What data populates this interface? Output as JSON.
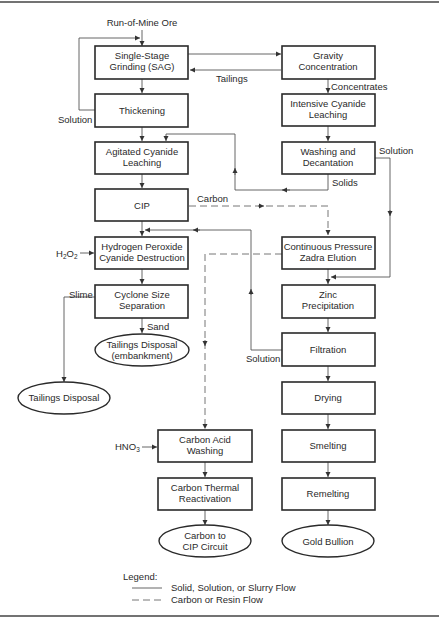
{
  "diagram": {
    "input_label": "Run-of-Mine Ore",
    "nodes": {
      "sag": {
        "line1": "Single-Stage",
        "line2": "Grinding (SAG)"
      },
      "thickening": {
        "line1": "Thickening"
      },
      "agitated": {
        "line1": "Agitated Cyanide",
        "line2": "Leaching"
      },
      "cip": {
        "line1": "CIP"
      },
      "peroxide": {
        "line1": "Hydrogen Peroxide",
        "line2": "Cyanide Destruction"
      },
      "cyclone": {
        "line1": "Cyclone Size",
        "line2": "Separation"
      },
      "tailings_embankment": {
        "line1": "Tailings Disposal",
        "line2": "(embankment)"
      },
      "tailings": {
        "line1": "Tailings Disposal"
      },
      "gravity": {
        "line1": "Gravity",
        "line2": "Concentration"
      },
      "intensive": {
        "line1": "Intensive Cyanide",
        "line2": "Leaching"
      },
      "washing": {
        "line1": "Washing and",
        "line2": "Decantation"
      },
      "zadra": {
        "line1": "Continuous Pressure",
        "line2": "Zadra Elution"
      },
      "zinc": {
        "line1": "Zinc",
        "line2": "Precipitation"
      },
      "filtration": {
        "line1": "Filtration"
      },
      "drying": {
        "line1": "Drying"
      },
      "smelting": {
        "line1": "Smelting"
      },
      "remelting": {
        "line1": "Remelting"
      },
      "gold": {
        "line1": "Gold Bullion"
      },
      "acid_wash": {
        "line1": "Carbon Acid",
        "line2": "Washing"
      },
      "thermal": {
        "line1": "Carbon Thermal",
        "line2": "Reactivation"
      },
      "carbon_cip": {
        "line1": "Carbon to",
        "line2": "CIP Circuit"
      }
    },
    "edge_labels": {
      "tailings": "Tailings",
      "concentrates": "Concentrates",
      "solution_thickening": "Solution",
      "solution_washing": "Solution",
      "solids": "Solids",
      "carbon": "Carbon",
      "slime": "Slime",
      "sand": "Sand",
      "solution_filtration": "Solution",
      "h2o2_main": "H",
      "h2o2_sub1": "2",
      "h2o2_mid": "O",
      "h2o2_sub2": "2",
      "hno3_main": "HNO",
      "hno3_sub": "3"
    },
    "legend": {
      "title": "Legend:",
      "solid": "Solid, Solution, or Slurry Flow",
      "dashed": "Carbon or Resin Flow"
    }
  }
}
